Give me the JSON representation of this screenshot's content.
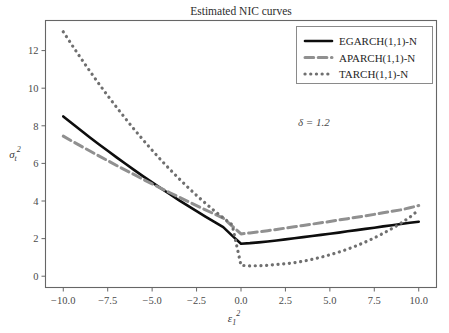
{
  "chart_data": {
    "type": "line",
    "title": "Estimated NIC curves",
    "xlabel": "ε₁²",
    "ylabel": "σₜ²",
    "xlabel_parts": {
      "base": "ε",
      "sub": "1",
      "sup": "2"
    },
    "ylabel_parts": {
      "base": "σ",
      "sub": "t",
      "sup": "2"
    },
    "xlim": [
      -11.0,
      11.0
    ],
    "ylim": [
      -0.6,
      13.6
    ],
    "xticks": [
      -10.0,
      -7.5,
      -5.0,
      -2.5,
      0.0,
      2.5,
      5.0,
      7.5,
      10.0
    ],
    "xtick_labels": [
      "−10.0",
      "−7.5",
      "−5.0",
      "−2.5",
      "0.0",
      "2.5",
      "5.0",
      "7.5",
      "10.0"
    ],
    "yticks": [
      0,
      2,
      4,
      6,
      8,
      10,
      12
    ],
    "ytick_labels": [
      "0",
      "2",
      "4",
      "6",
      "8",
      "10",
      "12"
    ],
    "grid": false,
    "legend_position": "upper right",
    "annotations": [
      {
        "text": "δ = 1.2",
        "x": 4.1,
        "y": 8.0
      }
    ],
    "x": [
      -10.0,
      -9.5,
      -9.0,
      -8.5,
      -8.0,
      -7.5,
      -7.0,
      -6.5,
      -6.0,
      -5.5,
      -5.0,
      -4.5,
      -4.0,
      -3.5,
      -3.0,
      -2.5,
      -2.0,
      -1.5,
      -1.0,
      -0.5,
      0.0,
      0.5,
      1.0,
      1.5,
      2.0,
      2.5,
      3.0,
      3.5,
      4.0,
      4.5,
      5.0,
      5.5,
      6.0,
      6.5,
      7.0,
      7.5,
      8.0,
      8.5,
      9.0,
      9.5,
      10.0
    ],
    "series": [
      {
        "name": "EGARCH(1,1)-N",
        "color": "#0d0d0d",
        "style": "solid",
        "width": 2.6,
        "values": [
          8.5,
          8.12,
          7.75,
          7.38,
          7.02,
          6.67,
          6.32,
          5.98,
          5.64,
          5.31,
          4.99,
          4.67,
          4.36,
          4.05,
          3.75,
          3.46,
          3.17,
          2.89,
          2.61,
          2.16,
          1.73,
          1.76,
          1.8,
          1.85,
          1.9,
          1.96,
          2.02,
          2.08,
          2.14,
          2.2,
          2.26,
          2.32,
          2.39,
          2.45,
          2.52,
          2.58,
          2.65,
          2.71,
          2.78,
          2.84,
          2.9
        ]
      },
      {
        "name": "APARCH(1,1)-N",
        "color": "#909090",
        "style": "dashed",
        "width": 3.0,
        "values": [
          7.45,
          7.18,
          6.92,
          6.66,
          6.4,
          6.15,
          5.89,
          5.64,
          5.4,
          5.15,
          4.91,
          4.67,
          4.44,
          4.21,
          3.98,
          3.75,
          3.53,
          3.31,
          3.09,
          2.67,
          2.25,
          2.3,
          2.36,
          2.42,
          2.49,
          2.56,
          2.63,
          2.7,
          2.77,
          2.84,
          2.91,
          2.99,
          3.06,
          3.14,
          3.21,
          3.29,
          3.37,
          3.45,
          3.53,
          3.64,
          3.76
        ]
      },
      {
        "name": "TARCH(1,1)-N",
        "color": "#6f6f6f",
        "style": "dotted",
        "width": 3.2,
        "values": [
          13.0,
          12.28,
          11.58,
          10.9,
          10.24,
          9.6,
          8.98,
          8.38,
          7.8,
          7.24,
          6.7,
          6.18,
          5.68,
          5.2,
          4.74,
          4.3,
          3.88,
          3.48,
          3.1,
          2.74,
          0.58,
          0.55,
          0.56,
          0.58,
          0.62,
          0.66,
          0.72,
          0.8,
          0.9,
          1.01,
          1.14,
          1.28,
          1.44,
          1.62,
          1.82,
          2.04,
          2.28,
          2.54,
          2.82,
          3.14,
          3.52
        ]
      }
    ],
    "legend_entries": [
      {
        "label": "EGARCH(1,1)-N",
        "color": "#0d0d0d",
        "style": "solid"
      },
      {
        "label": "APARCH(1,1)-N",
        "color": "#909090",
        "style": "dashed"
      },
      {
        "label": "TARCH(1,1)-N",
        "color": "#6f6f6f",
        "style": "dotted"
      }
    ]
  }
}
